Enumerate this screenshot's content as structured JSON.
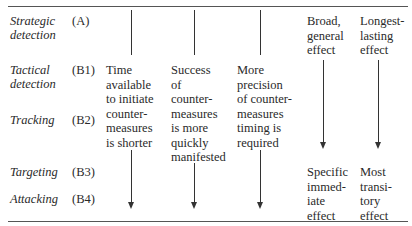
{
  "stages": [
    {
      "label_line1": "Strategic",
      "label_line2": "detection",
      "code": "(A)"
    },
    {
      "label_line1": "Tactical",
      "label_line2": "detection",
      "code": "(B1)"
    },
    {
      "label_line1": "Tracking",
      "label_line2": "",
      "code": "(B2)"
    },
    {
      "label_line1": "Targeting",
      "label_line2": "",
      "code": "(B3)"
    },
    {
      "label_line1": "Attacking",
      "label_line2": "",
      "code": "(B4)"
    }
  ],
  "columns": [
    {
      "lines": [
        "Time",
        "available",
        "to initiate",
        "counter-",
        "measures",
        "is shorter"
      ]
    },
    {
      "lines": [
        "Success",
        "of",
        "counter-",
        "measures",
        "is more",
        "quickly",
        "manifested"
      ]
    },
    {
      "lines": [
        "More",
        "precision",
        "of counter-",
        "measures",
        "timing is",
        "required"
      ]
    }
  ],
  "effects": {
    "top": [
      {
        "lines": [
          "Broad,",
          "general",
          "effect"
        ]
      },
      {
        "lines": [
          "Longest-",
          "lasting",
          "effect"
        ]
      }
    ],
    "bottom": [
      {
        "lines": [
          "Specific",
          "immed-",
          "iate",
          "effect"
        ]
      },
      {
        "lines": [
          "Most",
          "transi-",
          "tory",
          "effect"
        ]
      }
    ]
  }
}
